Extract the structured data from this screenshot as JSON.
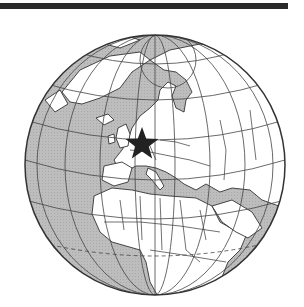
{
  "figure": {
    "type": "orthographic-globe-map",
    "region_shown": "Europe, Africa, Arctic, North Atlantic, Western Asia",
    "marker": {
      "shape": "star",
      "location": "Central Europe (Germany)",
      "color": "#222222"
    },
    "colors": {
      "ocean": "#b9b9b9",
      "land": "#ffffff",
      "borders": "#333333",
      "graticule": "#444444",
      "top_rule": "#2a2a2a"
    }
  }
}
